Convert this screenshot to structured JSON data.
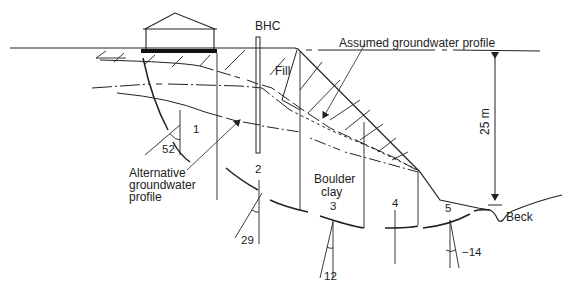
{
  "colors": {
    "ink": "#222222",
    "background": "#ffffff",
    "foundation": "#111111"
  },
  "labels": {
    "borehole": "BHC",
    "fill": "Fill",
    "assumed_gw": "Assumed groundwater profile",
    "alternative_gw_line1": "Alternative",
    "alternative_gw_line2": "groundwater",
    "alternative_gw_line3": "profile",
    "boulder_clay_line1": "Boulder",
    "boulder_clay_line2": "clay",
    "height": "25 m",
    "beck": "Beck"
  },
  "slices": [
    {
      "id": "1",
      "angle": "52"
    },
    {
      "id": "2",
      "angle": "29"
    },
    {
      "id": "3",
      "angle": "12"
    },
    {
      "id": "4",
      "angle": ""
    },
    {
      "id": "5",
      "angle": "−14"
    }
  ],
  "icons": {
    "building": "house-icon",
    "borehole": "borehole-icon",
    "dimension_arrow": "arrow-icon"
  }
}
